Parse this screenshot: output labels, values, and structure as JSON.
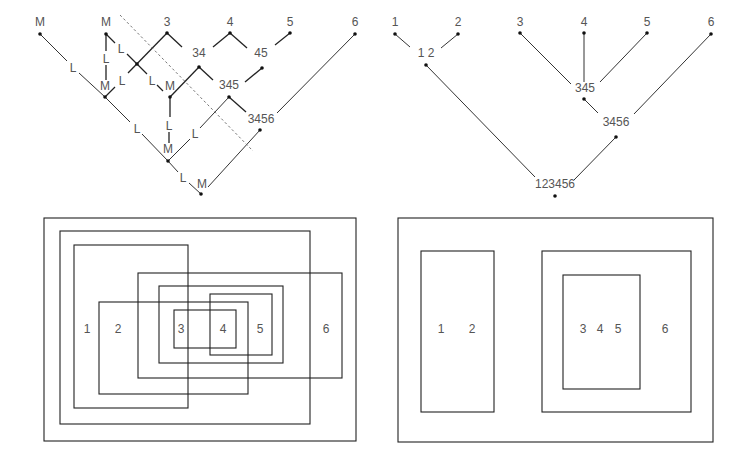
{
  "panels": {
    "top_left": {
      "type": "derivation-tree",
      "leaves": [
        "M",
        "M",
        "3",
        "4",
        "5",
        "6"
      ],
      "intermediate_nodes": [
        "34",
        "45",
        "345",
        "3456"
      ],
      "edge_labels": {
        "L": "L",
        "M": "M"
      }
    },
    "top_right": {
      "type": "hierarchical-tree",
      "leaves": [
        "1",
        "2",
        "3",
        "4",
        "5",
        "6"
      ],
      "nodes": [
        "1 2",
        "345",
        "3456",
        "123456"
      ]
    },
    "bottom_left": {
      "type": "overlapping-set-diagram",
      "labels": [
        "1",
        "2",
        "3",
        "4",
        "5",
        "6"
      ]
    },
    "bottom_right": {
      "type": "nested-set-diagram",
      "labels": [
        "1",
        "2",
        "3",
        "4",
        "5",
        "6"
      ]
    }
  },
  "colors": {
    "line": "#222222",
    "text": "#555555",
    "background": "#ffffff"
  }
}
